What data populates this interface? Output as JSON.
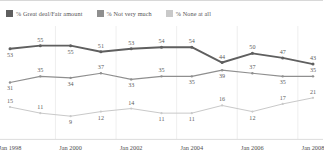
{
  "legend": {
    "items": [
      {
        "label": "% Great deal/Fair amount",
        "color": "#5f5f5f",
        "icon": "square-swatch-icon"
      },
      {
        "label": "% Not very much",
        "color": "#8f8f8f",
        "icon": "square-swatch-icon"
      },
      {
        "label": "% None at all",
        "color": "#c9c9c9",
        "icon": "square-swatch-icon"
      }
    ]
  },
  "chart_data": {
    "type": "line",
    "title": "",
    "subtitle": "",
    "xlabel": "",
    "ylabel": "",
    "ylim": [
      0,
      60
    ],
    "grid": true,
    "legend_position": "top-left",
    "x": [
      "Jan 1998",
      "Jan 1999",
      "Jan 2000",
      "Jan 2001",
      "Jan 2002",
      "Jan 2003",
      "Jan 2004",
      "Jan 2005",
      "Jan 2006",
      "Jan 2007",
      "Jan 2008"
    ],
    "tick_labels": [
      "Jan 1998",
      "Jan 2000",
      "Jan 2002",
      "Jan 2004",
      "Jan 2006",
      "Jan 2008"
    ],
    "tick_indices": [
      0,
      2,
      4,
      6,
      8,
      10
    ],
    "series": [
      {
        "name": "% Great deal/Fair amount",
        "color": "#5f5f5f",
        "values": [
          53,
          55,
          55,
          51,
          53,
          54,
          54,
          44,
          50,
          47,
          43
        ],
        "point_labels": [
          "53",
          "55",
          "55",
          "51",
          "53",
          "54",
          "54",
          "44",
          "50",
          "47",
          "43"
        ],
        "label_positions": [
          "below",
          "above",
          "below",
          "above",
          "above",
          "above",
          "above",
          "above",
          "above",
          "above",
          "above"
        ]
      },
      {
        "name": "% Not very much",
        "color": "#8f8f8f",
        "values": [
          31,
          35,
          34,
          37,
          33,
          35,
          35,
          39,
          37,
          35,
          35
        ],
        "point_labels": [
          "31",
          "35",
          "34",
          "37",
          "33",
          "35",
          "35",
          "39",
          "37",
          "35",
          "35"
        ],
        "label_positions": [
          "below",
          "above",
          "below",
          "above",
          "below",
          "above",
          "below",
          "below",
          "above",
          "below",
          "above"
        ]
      },
      {
        "name": "% None at all",
        "color": "#c9c9c9",
        "values": [
          15,
          11,
          9,
          12,
          14,
          11,
          11,
          16,
          12,
          17,
          21
        ],
        "point_labels": [
          "15",
          "11",
          "9",
          "12",
          "14",
          "11",
          "11",
          "16",
          "12",
          "17",
          "21"
        ],
        "label_positions": [
          "above",
          "above",
          "below",
          "below",
          "above",
          "below",
          "below",
          "above",
          "below",
          "above",
          "above"
        ]
      }
    ]
  }
}
